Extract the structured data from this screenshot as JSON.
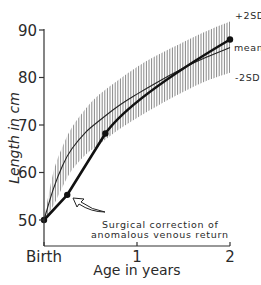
{
  "chart_data": {
    "type": "line",
    "title": "",
    "xlabel": "Age in years",
    "ylabel": "Length in cm",
    "xlim": [
      0,
      2
    ],
    "ylim": [
      45,
      92
    ],
    "x_ticks": [
      {
        "value": 0,
        "label": "Birth"
      },
      {
        "value": 1,
        "label": "1"
      },
      {
        "value": 2,
        "label": "2"
      }
    ],
    "y_ticks": [
      {
        "value": 50,
        "label": "50"
      },
      {
        "value": 60,
        "label": "60"
      },
      {
        "value": 70,
        "label": "70"
      },
      {
        "value": 80,
        "label": "80"
      },
      {
        "value": 90,
        "label": "90"
      }
    ],
    "grid": false,
    "series": [
      {
        "name": "patient",
        "style": "thick line with markers",
        "x": [
          0,
          0.25,
          0.66,
          2.0
        ],
        "y": [
          50,
          55.3,
          68.2,
          88.0
        ]
      },
      {
        "name": "mean",
        "style": "thin line",
        "x": [
          0,
          0.1,
          0.2,
          0.3,
          0.45,
          0.6,
          0.8,
          1.0,
          1.2,
          1.5,
          1.75,
          2.0
        ],
        "y": [
          50,
          56.5,
          61.5,
          65.0,
          68.5,
          71.0,
          74.0,
          76.5,
          78.8,
          82.0,
          84.3,
          86.3
        ]
      },
      {
        "name": "+2SD",
        "style": "upper edge of hatched band",
        "x": [
          0,
          0.1,
          0.2,
          0.3,
          0.45,
          0.6,
          0.8,
          1.0,
          1.2,
          1.5,
          1.75,
          2.0
        ],
        "y": [
          50,
          60.0,
          65.5,
          69.5,
          73.5,
          76.5,
          79.5,
          82.2,
          84.5,
          87.5,
          89.8,
          91.8
        ]
      },
      {
        "name": "-2SD",
        "style": "lower edge of hatched band",
        "x": [
          0,
          0.1,
          0.2,
          0.3,
          0.45,
          0.6,
          0.8,
          1.0,
          1.2,
          1.5,
          1.75,
          2.0
        ],
        "y": [
          50,
          53.0,
          57.0,
          60.5,
          63.8,
          66.0,
          69.0,
          71.5,
          73.8,
          77.0,
          79.3,
          81.0
        ]
      }
    ],
    "band_labels": {
      "upper": "+2SD",
      "mean": "mean",
      "lower": "-2SD"
    },
    "annotations": [
      {
        "text_line1": "Surgical correction of",
        "text_line2": "anomalous venous return",
        "points_to": {
          "x": 0.25,
          "y": 55.3
        }
      }
    ],
    "legend": null
  }
}
